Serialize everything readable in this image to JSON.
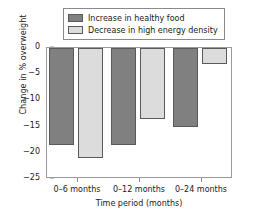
{
  "chart_data": {
    "type": "bar",
    "title": "",
    "xlabel": "Time period (months)",
    "ylabel": "Change in % overweight",
    "categories": [
      "0–6 months",
      "0–12 months",
      "0–24 months"
    ],
    "series": [
      {
        "name": "Increase in healthy food",
        "color": "#808080",
        "values": [
          -18.5,
          -18.5,
          -15.0
        ]
      },
      {
        "name": "Decrease in high energy density",
        "color": "#dcdcdc",
        "values": [
          -21.0,
          -13.5,
          -3.0
        ]
      }
    ],
    "ylim": [
      -25,
      0
    ],
    "yticks": [
      0,
      -5,
      -10,
      -15,
      -20,
      -25
    ],
    "ytick_labels": [
      "0",
      "−5",
      "−10",
      "−15",
      "−20",
      "−25"
    ],
    "grid": false,
    "legend_position": "top-center",
    "frame": true
  },
  "legend": {
    "entries": [
      {
        "label": "Increase in healthy food"
      },
      {
        "label": "Decrease in high energy density"
      }
    ]
  }
}
